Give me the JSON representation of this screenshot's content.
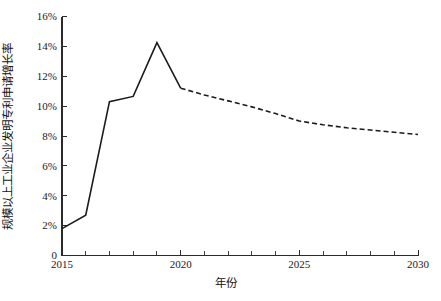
{
  "chart_data": {
    "type": "line",
    "title": "",
    "xlabel": "年份",
    "ylabel": "规模以上工业企业发明专利申请增长率",
    "xlim": [
      2015,
      2030
    ],
    "ylim": [
      0,
      16
    ],
    "grid": false,
    "legend": "none",
    "x_tick_labels": [
      "2015",
      "2020",
      "2025",
      "2030"
    ],
    "x_tick_values": [
      2015,
      2020,
      2025,
      2030
    ],
    "x_minor_tick_values": [
      2016,
      2017,
      2018,
      2019,
      2021,
      2022,
      2023,
      2024,
      2026,
      2027,
      2028,
      2029
    ],
    "y_tick_labels": [
      "0",
      "2%",
      "4%",
      "6%",
      "8%",
      "10%",
      "12%",
      "14%",
      "16%"
    ],
    "y_tick_values": [
      0,
      2,
      4,
      6,
      8,
      10,
      12,
      14,
      16
    ],
    "y_unit": "%",
    "series": [
      {
        "name": "历史值",
        "style": "solid",
        "color": "#1c1c1c",
        "x": [
          2015,
          2016,
          2017,
          2018,
          2019,
          2020
        ],
        "values": [
          1.8,
          2.7,
          10.3,
          10.65,
          14.25,
          11.2
        ]
      },
      {
        "name": "预测值",
        "style": "dashed",
        "color": "#1c1c1c",
        "x": [
          2020,
          2021,
          2022,
          2023,
          2024,
          2025,
          2026,
          2027,
          2028,
          2029,
          2030
        ],
        "values": [
          11.2,
          10.75,
          10.35,
          9.95,
          9.5,
          9.0,
          8.75,
          8.55,
          8.4,
          8.25,
          8.1
        ]
      }
    ],
    "annotations": []
  },
  "figure": {
    "caption": ""
  },
  "axis": {
    "x_title": "年份",
    "y_title": "规模以上工业企业发明专利申请增长率"
  }
}
